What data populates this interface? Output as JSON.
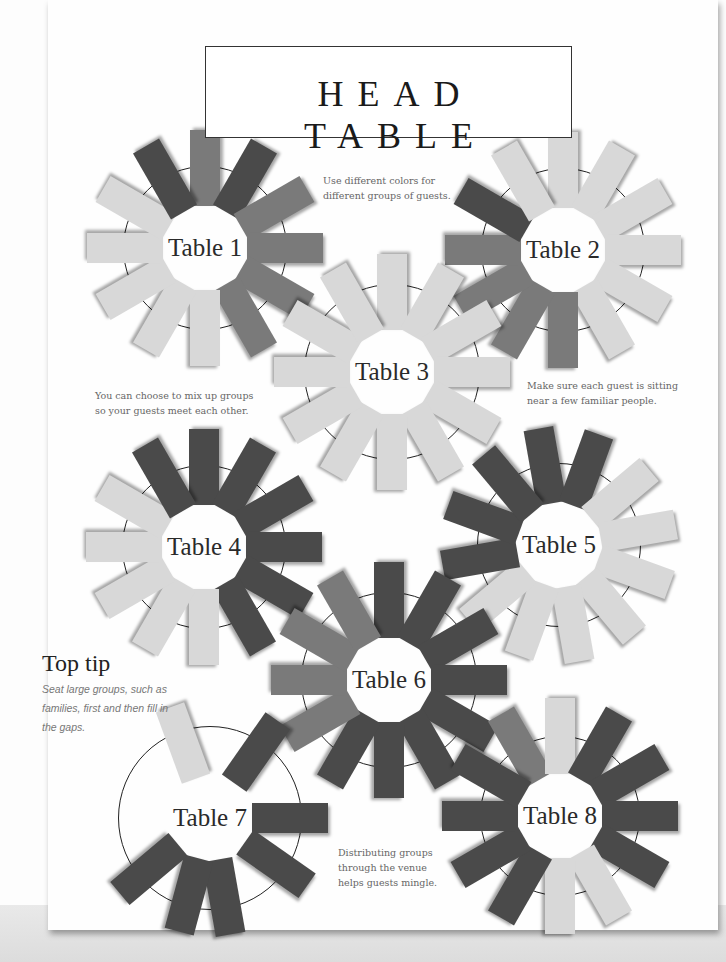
{
  "head_table": {
    "title": "HEAD TABLE"
  },
  "notes": [
    {
      "id": "colors",
      "lines": [
        "Use different colors for",
        "different groups of guests."
      ],
      "x": 323,
      "y": 173
    },
    {
      "id": "mix",
      "lines": [
        "You can choose to mix up groups",
        "so your guests meet each other."
      ],
      "x": 95,
      "y": 388
    },
    {
      "id": "familiar",
      "lines": [
        "Make sure each guest is sitting",
        "near a few familiar people."
      ],
      "x": 527,
      "y": 378
    },
    {
      "id": "distribute",
      "lines": [
        "Distributing groups",
        "through the venue",
        "helps guests mingle."
      ],
      "x": 338,
      "y": 845
    }
  ],
  "top_tip": {
    "title": "Top tip",
    "body": "Seat large groups, such as families, first and then fill in the gaps."
  },
  "colors": {
    "dark": "#4a4a4a",
    "mid": "#7a7a7a",
    "light": "#d8d8d8",
    "ring": "#222222"
  },
  "tables": [
    {
      "label": "Table 1",
      "cx": 205,
      "cy": 248,
      "r": 82,
      "label_dx": 0,
      "cards": [
        "mid",
        "dark",
        "mid",
        "mid",
        "mid",
        "mid",
        "light",
        "light",
        "light",
        "light",
        "light",
        "dark"
      ],
      "start": -90
    },
    {
      "label": "Table 2",
      "cx": 563,
      "cy": 250,
      "r": 82,
      "label_dx": 0,
      "cards": [
        "light",
        "light",
        "light",
        "light",
        "light",
        "light",
        "mid",
        "mid",
        "mid",
        "mid",
        "dark",
        "light"
      ],
      "start": -90
    },
    {
      "label": "Table 3",
      "cx": 392,
      "cy": 372,
      "r": 88,
      "label_dx": 0,
      "cards": [
        "light",
        "light",
        "light",
        "light",
        "light",
        "light",
        "light",
        "light",
        "light",
        "light",
        "light",
        "light"
      ],
      "start": -90
    },
    {
      "label": "Table 4",
      "cx": 204,
      "cy": 547,
      "r": 82,
      "label_dx": 0,
      "cards": [
        "dark",
        "dark",
        "dark",
        "dark",
        "dark",
        "dark",
        "light",
        "light",
        "light",
        "light",
        "light",
        "dark"
      ],
      "start": -90
    },
    {
      "label": "Table 5",
      "cx": 559,
      "cy": 545,
      "r": 82,
      "label_dx": 0,
      "cards": [
        "dark",
        "dark",
        "light",
        "light",
        "light",
        "light",
        "light",
        "light",
        "light",
        "dark",
        "dark",
        "dark"
      ],
      "start": -100
    },
    {
      "label": "Table 6",
      "cx": 389,
      "cy": 680,
      "r": 88,
      "label_dx": 0,
      "cards": [
        "dark",
        "dark",
        "dark",
        "dark",
        "dark",
        "dark",
        "dark",
        "dark",
        "mid",
        "mid",
        "mid",
        "mid"
      ],
      "start": -90
    },
    {
      "label": "Table 7",
      "cx": 210,
      "cy": 818,
      "r": 92,
      "label_dx": 0,
      "cards": [
        "light",
        "dark",
        "dark",
        "dark",
        "dark",
        "dark",
        "dark"
      ],
      "angles": [
        -110,
        -55,
        0,
        35,
        80,
        105,
        140
      ],
      "start": -90
    },
    {
      "label": "Table 8",
      "cx": 560,
      "cy": 816,
      "r": 80,
      "label_dx": 0,
      "cards": [
        "mid",
        "light",
        "dark",
        "dark",
        "dark",
        "dark",
        "light",
        "light",
        "dark",
        "dark",
        "dark",
        "dark"
      ],
      "start": -120
    }
  ]
}
